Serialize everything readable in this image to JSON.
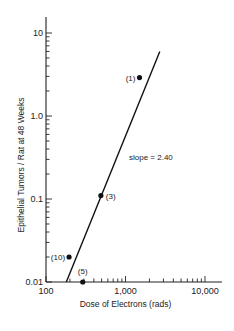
{
  "chart_data": {
    "type": "scatter",
    "title": "",
    "xlabel": "Dose of Electrons (rads)",
    "ylabel": "Epithelial Tumors / Rat at 48 Weeks",
    "xscale": "log",
    "yscale": "log",
    "xlim": [
      100,
      20000
    ],
    "ylim": [
      0.01,
      20
    ],
    "x_ticks": [
      "100",
      "1,000",
      "10,000"
    ],
    "y_ticks": [
      "0.01",
      "0.1",
      "1.0",
      "10"
    ],
    "grid": false,
    "series": [
      {
        "name": "observed",
        "points": [
          {
            "label": "(10)",
            "x": 195,
            "y": 0.02
          },
          {
            "label": "(5)",
            "x": 290,
            "y": 0.01
          },
          {
            "label": "(3)",
            "x": 490,
            "y": 0.11
          },
          {
            "label": "(1)",
            "x": 1500,
            "y": 2.9
          }
        ]
      },
      {
        "name": "fit line",
        "type": "line",
        "points": [
          {
            "x": 180,
            "y": 0.01
          },
          {
            "x": 2700,
            "y": 6.0
          }
        ]
      }
    ],
    "annotations": [
      "slope = 2.40"
    ]
  }
}
